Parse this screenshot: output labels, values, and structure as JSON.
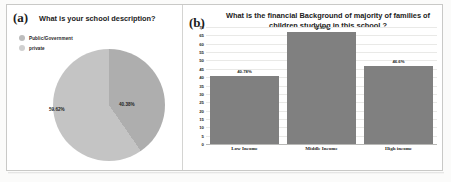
{
  "figure": {
    "background": "#ffffff",
    "border_color": "#c9c9c7"
  },
  "panel_a": {
    "tag": "(a)",
    "title": "What is your school description?",
    "legend": [
      {
        "label": "Public/Government",
        "color": "#bdbdbd"
      },
      {
        "label": "private",
        "color": "#d0d0d0"
      }
    ],
    "chart_data": {
      "type": "pie",
      "title": "What is your school description?",
      "labels": [
        "Public/Government",
        "private"
      ],
      "values": [
        59.62,
        40.38
      ],
      "value_labels": [
        "59.62%",
        "40.38%"
      ],
      "colors": [
        "#c4c4c4",
        "#aeaeae"
      ],
      "legend_position": "top-left",
      "start_angle_deg": 0,
      "units": "percent"
    }
  },
  "panel_b": {
    "tag": "(b)",
    "title": "What is the financial Background of majority of families of children studying in this school ?",
    "chart_data": {
      "type": "bar",
      "title": "What is the financial Background of majority of families of children studying in this school ?",
      "categories": [
        "Low Income",
        "Middle Income",
        "High income"
      ],
      "values": [
        40.78,
        66.8,
        46.6
      ],
      "value_labels": [
        "40.78%",
        "66.80%",
        "46.6%"
      ],
      "bar_color": "#808080",
      "xlabel": "",
      "ylabel": "",
      "ylim": [
        0,
        70
      ],
      "yticks": [
        70,
        65,
        60,
        55,
        50,
        45,
        40,
        35,
        30,
        25,
        20,
        15,
        10,
        5,
        0
      ],
      "grid": true,
      "legend_position": "none",
      "units": "percent"
    }
  }
}
